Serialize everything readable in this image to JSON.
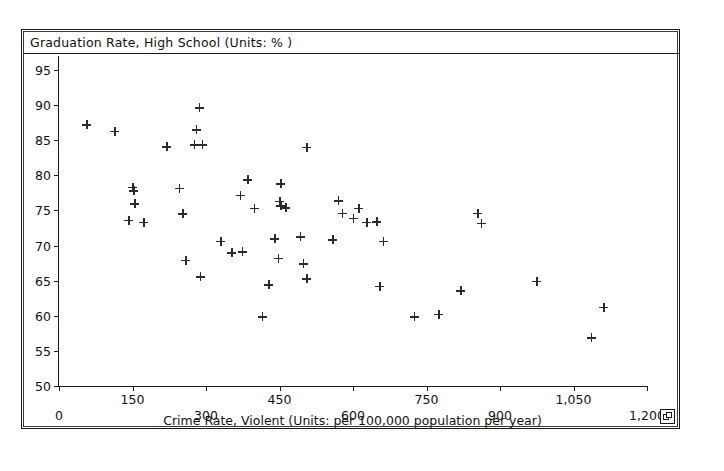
{
  "window": {
    "title": "Graduation Rate, High School (Units: % )",
    "corner_widget_icon": "resize-handle-icon"
  },
  "chart_data": {
    "type": "scatter",
    "title": "Graduation Rate, High School (Units: % )",
    "xlabel": "Crime Rate, Violent (Units: per 100,000 population per year)",
    "ylabel": "Graduation Rate, High School (Units: % )",
    "xlim": [
      0,
      1200
    ],
    "ylim": [
      50,
      97
    ],
    "grid": false,
    "legend": null,
    "marker": "plus",
    "marker_color": "#2b2b2b",
    "x_ticks": [
      0,
      150,
      300,
      450,
      600,
      750,
      900,
      1050,
      1200
    ],
    "x_tick_labels": [
      "0",
      "150",
      "300",
      "450",
      "600",
      "750",
      "900",
      "1,050",
      "1,200"
    ],
    "x_tick_label_rows": [
      1,
      0,
      1,
      0,
      1,
      0,
      1,
      0,
      1
    ],
    "y_ticks": [
      50,
      55,
      60,
      65,
      70,
      75,
      80,
      85,
      90,
      95
    ],
    "y_tick_labels": [
      "50",
      "55",
      "60",
      "65",
      "70",
      "75",
      "80",
      "85",
      "90",
      "95"
    ],
    "points": [
      {
        "x": 57,
        "y": 87.2
      },
      {
        "x": 114,
        "y": 86.3
      },
      {
        "x": 150,
        "y": 78.3
      },
      {
        "x": 152,
        "y": 77.8
      },
      {
        "x": 155,
        "y": 76.0
      },
      {
        "x": 142,
        "y": 73.6
      },
      {
        "x": 173,
        "y": 73.3
      },
      {
        "x": 220,
        "y": 84.1
      },
      {
        "x": 245,
        "y": 78.2
      },
      {
        "x": 252,
        "y": 74.5
      },
      {
        "x": 258,
        "y": 67.9
      },
      {
        "x": 286,
        "y": 89.6
      },
      {
        "x": 280,
        "y": 86.5
      },
      {
        "x": 276,
        "y": 84.4
      },
      {
        "x": 292,
        "y": 84.4
      },
      {
        "x": 288,
        "y": 65.6
      },
      {
        "x": 330,
        "y": 70.6
      },
      {
        "x": 352,
        "y": 69.0
      },
      {
        "x": 374,
        "y": 69.1
      },
      {
        "x": 385,
        "y": 79.4
      },
      {
        "x": 370,
        "y": 77.2
      },
      {
        "x": 398,
        "y": 75.3
      },
      {
        "x": 452,
        "y": 78.8
      },
      {
        "x": 450,
        "y": 76.3
      },
      {
        "x": 452,
        "y": 75.7
      },
      {
        "x": 463,
        "y": 75.4
      },
      {
        "x": 440,
        "y": 71.0
      },
      {
        "x": 447,
        "y": 68.2
      },
      {
        "x": 428,
        "y": 64.4
      },
      {
        "x": 415,
        "y": 59.9
      },
      {
        "x": 505,
        "y": 84.0
      },
      {
        "x": 492,
        "y": 71.3
      },
      {
        "x": 498,
        "y": 67.4
      },
      {
        "x": 505,
        "y": 65.3
      },
      {
        "x": 558,
        "y": 70.8
      },
      {
        "x": 570,
        "y": 76.4
      },
      {
        "x": 578,
        "y": 74.6
      },
      {
        "x": 600,
        "y": 73.9
      },
      {
        "x": 612,
        "y": 75.3
      },
      {
        "x": 628,
        "y": 73.3
      },
      {
        "x": 648,
        "y": 73.4
      },
      {
        "x": 662,
        "y": 70.6
      },
      {
        "x": 655,
        "y": 64.2
      },
      {
        "x": 725,
        "y": 59.9
      },
      {
        "x": 775,
        "y": 60.2
      },
      {
        "x": 820,
        "y": 63.6
      },
      {
        "x": 855,
        "y": 74.6
      },
      {
        "x": 862,
        "y": 73.2
      },
      {
        "x": 975,
        "y": 64.9
      },
      {
        "x": 1086,
        "y": 56.9
      },
      {
        "x": 1112,
        "y": 61.2
      }
    ]
  }
}
